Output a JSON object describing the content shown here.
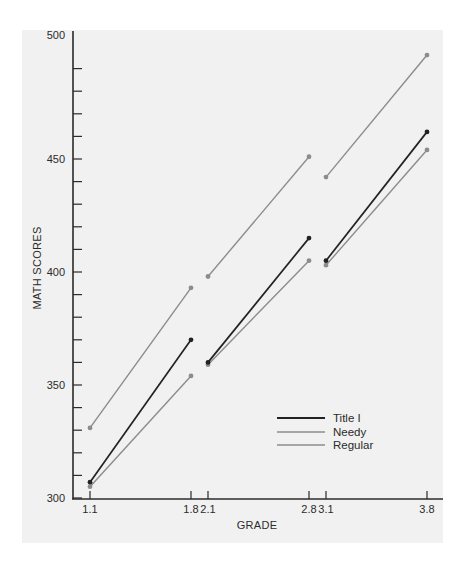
{
  "chart_data": {
    "type": "line",
    "title": "",
    "xlabel": "GRADE",
    "ylabel": "MATH SCORES",
    "ylim": [
      300,
      500
    ],
    "y_major_ticks": [
      300,
      350,
      400,
      450,
      500
    ],
    "y_minor_step": 10,
    "x_ticks": [
      "1.1",
      "1.8",
      "2.1",
      "2.8",
      "3.1",
      "3.8"
    ],
    "x": [
      1.1,
      1.8,
      2.1,
      2.8,
      3.1,
      3.8
    ],
    "segments_note": "Each series is drawn as three separate segments: 1.1-1.8, 2.1-2.8, 3.1-3.8",
    "series": [
      {
        "name": "Title I",
        "color": "#222222",
        "values": [
          307,
          370,
          360,
          415,
          405,
          462
        ]
      },
      {
        "name": "Needy",
        "color": "#8c8c8c",
        "values": [
          305,
          354,
          359,
          405,
          403,
          454
        ]
      },
      {
        "name": "Regular",
        "color": "#8c8c8c",
        "values": [
          331,
          393,
          398,
          451,
          442,
          496
        ]
      }
    ],
    "grid": false,
    "legend_position": "lower right, inside plot",
    "legend": [
      "Title I",
      "Needy",
      "Regular"
    ]
  },
  "colors": {
    "background": "#f1f1f1",
    "axis": "#2b2b2b"
  }
}
